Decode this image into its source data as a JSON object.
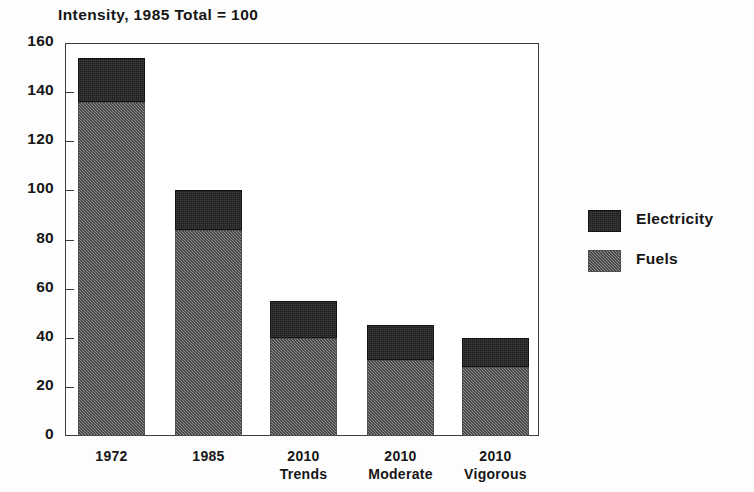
{
  "chart_data": {
    "type": "bar",
    "subtype": "stacked-vertical",
    "title": "Intensity, 1985 Total = 100",
    "xlabel": "",
    "ylabel": "",
    "ylim": [
      0,
      160
    ],
    "yticks": [
      0,
      20,
      40,
      60,
      80,
      100,
      120,
      140,
      160
    ],
    "ytick_labels": [
      "0",
      "20",
      "40",
      "60",
      "80",
      "100",
      "120",
      "140",
      "160"
    ],
    "grid": false,
    "legend_position": "right",
    "categories": [
      "1972",
      "1985",
      "2010 Trends",
      "2010 Moderate",
      "2010 Vigorous"
    ],
    "category_lines": [
      {
        "line1": "1972",
        "line2": ""
      },
      {
        "line1": "1985",
        "line2": ""
      },
      {
        "line1": "2010",
        "line2": "Trends"
      },
      {
        "line1": "2010",
        "line2": "Moderate"
      },
      {
        "line1": "2010",
        "line2": "Vigorous"
      }
    ],
    "series": [
      {
        "name": "Fuels",
        "color": "#6e6e6e",
        "values": [
          136,
          84,
          40,
          31,
          28
        ]
      },
      {
        "name": "Electricity",
        "color": "#1d1d1d",
        "values": [
          18,
          16,
          15,
          14,
          12
        ]
      }
    ],
    "totals": [
      154,
      100,
      55,
      45,
      40
    ],
    "legend": [
      {
        "label": "Electricity",
        "color": "#1d1d1d"
      },
      {
        "label": "Fuels",
        "color": "#6e6e6e"
      }
    ]
  }
}
